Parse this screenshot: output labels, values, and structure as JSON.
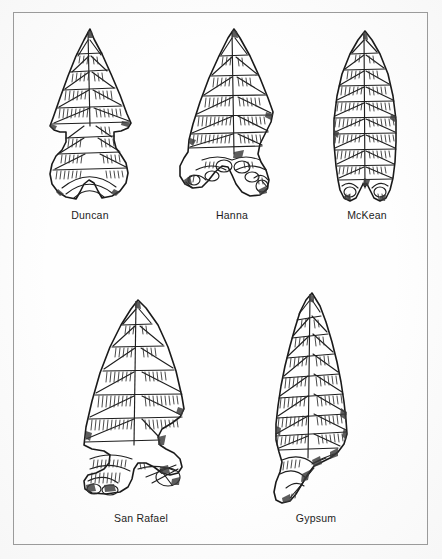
{
  "figure": {
    "kind": "archaeological-figure-plate",
    "background_color": "#fefefe",
    "border_color": "#9b9b9b",
    "ink_color": "#1a1a1a"
  },
  "rows": [
    {
      "row_index": 1,
      "specimens": [
        {
          "label": "Duncan",
          "form": "side-notched-indented-base"
        },
        {
          "label": "Hanna",
          "form": "expanding-stem-flaring-ears"
        },
        {
          "label": "McKean",
          "form": "lanceolate-concave-base"
        }
      ]
    },
    {
      "row_index": 2,
      "specimens": [
        {
          "label": "San Rafael",
          "form": "side-notched-expanding-stem"
        },
        {
          "label": "Gypsum",
          "form": "contracting-stem"
        }
      ]
    }
  ],
  "captions": {
    "duncan": "Duncan",
    "hanna": "Hanna",
    "mckean": "McKean",
    "san_rafael": "San Rafael",
    "gypsum": "Gypsum"
  }
}
